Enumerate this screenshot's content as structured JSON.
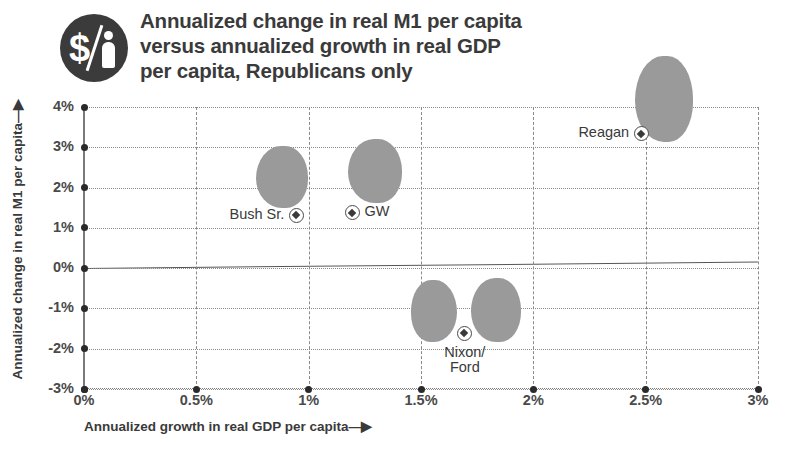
{
  "header": {
    "title": "Annualized change in real M1 per capita\nversus annualized growth in real GDP\nper capita, Republicans only",
    "logo_icon": "dollar-person-badge-icon"
  },
  "chart_data": {
    "type": "scatter",
    "title": "Annualized change in real M1 per capita versus annualized growth in real GDP per capita, Republicans only",
    "xlabel": "Annualized growth in real GDP per capita—▶",
    "ylabel": "Annualized change in real M1 per capita —▶",
    "xlim": [
      0,
      3
    ],
    "ylim": [
      -3,
      4
    ],
    "xticks": [
      "0%",
      "0.5%",
      "1%",
      "1.5%",
      "2%",
      "2.5%",
      "3%"
    ],
    "xtick_values": [
      0,
      0.5,
      1,
      1.5,
      2,
      2.5,
      3
    ],
    "yticks": [
      "4%",
      "3%",
      "2%",
      "1%",
      "0%",
      "-1%",
      "-2%",
      "-3%"
    ],
    "ytick_values": [
      4,
      3,
      2,
      1,
      0,
      -1,
      -2,
      -3
    ],
    "grid": true,
    "legend": "none",
    "zero_line": true,
    "points": [
      {
        "label": "Bush Sr.",
        "x": 0.945,
        "y": 1.3,
        "label_side": "left"
      },
      {
        "label": "GW",
        "x": 1.195,
        "y": 1.37,
        "label_side": "right"
      },
      {
        "label": "Nixon/\nFord",
        "x": 1.695,
        "y": -1.63,
        "label_side": "below"
      },
      {
        "label": "Reagan",
        "x": 2.48,
        "y": 3.33,
        "label_side": "left"
      }
    ]
  },
  "axes": {
    "x_title": "Annualized growth in real GDP per capita",
    "x_arrow": "—▶",
    "y_title": "Annualized change in real M1 per capita",
    "y_arrow": "—▶",
    "y_labels": [
      "4%",
      "3%",
      "2%",
      "1%",
      "0%",
      "-1%",
      "-2%",
      "-3%"
    ],
    "x_labels": [
      "0%",
      "0.5%",
      "1%",
      "1.5%",
      "2%",
      "2.5%",
      "3%"
    ]
  },
  "points_display": {
    "bush_sr": "Bush Sr.",
    "gw": "GW",
    "nixon_ford": "Nixon/\nFord",
    "reagan": "Reagan"
  },
  "colors": {
    "silhouette": "#9a9a9a",
    "text": "#3a3a3a",
    "grid": "#8a8a8a",
    "badge": "#3b3b3b"
  }
}
